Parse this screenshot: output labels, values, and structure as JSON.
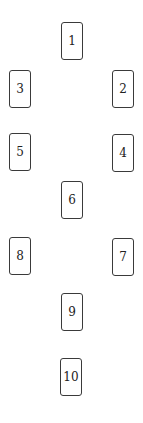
{
  "diagram": {
    "type": "card-spread",
    "cards": [
      {
        "label": "1",
        "x": 61,
        "y": 22
      },
      {
        "label": "2",
        "x": 112,
        "y": 70
      },
      {
        "label": "3",
        "x": 9,
        "y": 70
      },
      {
        "label": "4",
        "x": 112,
        "y": 134
      },
      {
        "label": "5",
        "x": 9,
        "y": 133
      },
      {
        "label": "6",
        "x": 61,
        "y": 181
      },
      {
        "label": "7",
        "x": 112,
        "y": 238
      },
      {
        "label": "8",
        "x": 9,
        "y": 237
      },
      {
        "label": "9",
        "x": 61,
        "y": 293
      },
      {
        "label": "10",
        "x": 60,
        "y": 358
      }
    ],
    "colors": {
      "border": "#3a3a3a",
      "text": "#222222",
      "background": "#ffffff"
    }
  }
}
